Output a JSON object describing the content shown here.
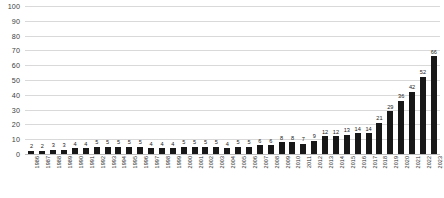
{
  "chart_data": {
    "type": "bar",
    "title": "",
    "subtitle": "",
    "xlabel": "",
    "ylabel": "",
    "ylim": [
      0,
      100
    ],
    "yticks": [
      0,
      10,
      20,
      30,
      40,
      50,
      60,
      70,
      80,
      90,
      100
    ],
    "grid": true,
    "legend": false,
    "legend_position": "none",
    "bar_color": "#181818",
    "gridline_color": "#d9d9d9",
    "categories": [
      "1986",
      "1987",
      "1988",
      "1989",
      "1990",
      "1991",
      "1992",
      "1993",
      "1994",
      "1995",
      "1996",
      "1997",
      "1998",
      "1999",
      "2000",
      "2001",
      "2002",
      "2003",
      "2004",
      "2005",
      "2006",
      "2007",
      "2008",
      "2009",
      "2010",
      "2011",
      "2012",
      "2013",
      "2014",
      "2015",
      "2016",
      "2017",
      "2018",
      "2019",
      "2020",
      "2021",
      "2022",
      "2023"
    ],
    "values": [
      2,
      2,
      3,
      3,
      4,
      4,
      5,
      5,
      5,
      5,
      5,
      4,
      4,
      4,
      5,
      5,
      5,
      5,
      4,
      5,
      5,
      6,
      6,
      8,
      8,
      7,
      9,
      12,
      12,
      13,
      14,
      14,
      21,
      29,
      36,
      42,
      52,
      66
    ],
    "data_labels": [
      "2",
      "2",
      "3",
      "3",
      "4",
      "4",
      "5",
      "5",
      "5",
      "5",
      "5",
      "4",
      "4",
      "4",
      "5",
      "5",
      "5",
      "5",
      "4",
      "5",
      "5",
      "6",
      "6",
      "8",
      "8",
      "7",
      "9",
      "12",
      "12",
      "13",
      "14",
      "14",
      "21",
      "29",
      "36",
      "42",
      "52",
      "66"
    ]
  }
}
